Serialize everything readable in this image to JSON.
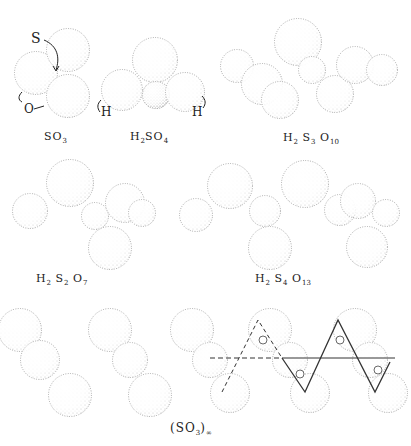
{
  "figure": {
    "atom_labels": {
      "sulfur": "S",
      "oxygen": "O",
      "hydrogen_left": "H",
      "hydrogen_right": "H"
    },
    "molecules": [
      {
        "id": "so3",
        "formula_parts": [
          {
            "t": "SO",
            "s": "3"
          }
        ],
        "text": "SO3"
      },
      {
        "id": "h2so4",
        "formula_parts": [
          {
            "t": "H",
            "s": "2"
          },
          {
            "t": "SO",
            "s": "4"
          }
        ],
        "text": "H2SO4"
      },
      {
        "id": "h2s3o10",
        "formula_parts": [
          {
            "t": "H",
            "s": "2"
          },
          {
            "t": " S",
            "s": "3"
          },
          {
            "t": " O",
            "s": "10"
          }
        ],
        "text": "H2S3O10"
      },
      {
        "id": "h2s2o7",
        "formula_parts": [
          {
            "t": "H",
            "s": "2"
          },
          {
            "t": " S",
            "s": "2"
          },
          {
            "t": " O",
            "s": "7"
          }
        ],
        "text": "H2S2O7"
      },
      {
        "id": "h2s4o13",
        "formula_parts": [
          {
            "t": "H",
            "s": "2"
          },
          {
            "t": " S",
            "s": "4"
          },
          {
            "t": " O",
            "s": "13"
          }
        ],
        "text": "H2S4O13"
      },
      {
        "id": "so3-polymer",
        "formula_parts": [
          {
            "t": "(SO",
            "s": "3"
          },
          {
            "t": ")",
            "s": "∞"
          }
        ],
        "text": "(SO3)∞"
      }
    ],
    "colors": {
      "ink": "#222222",
      "paper": "#ffffff",
      "stipple": "#555555"
    }
  }
}
